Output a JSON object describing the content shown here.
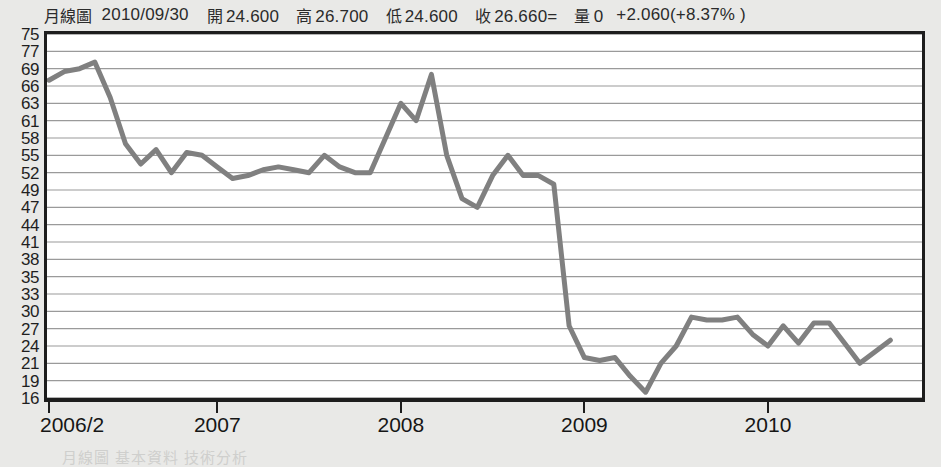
{
  "quote": {
    "chart_type_label": "月線圖",
    "date": "2010/09/30",
    "open_label": "開",
    "open": "24.600",
    "high_label": "高",
    "high": "26.700",
    "low_label": "低",
    "low": "24.600",
    "close_label": "收",
    "close": "26.660=",
    "volume_label": "量",
    "volume": "0",
    "change": "+2.060(+8.37% )"
  },
  "footnote": "月線圖 基本資料 技術分析",
  "colors": {
    "line": "#808080",
    "gridline": "#9a9a9a",
    "frame": "#1d1d1d",
    "plot_background": "#ffffff",
    "page_background": "#e9e9e7",
    "text": "#1f1f1f"
  },
  "chart_data": {
    "type": "line",
    "title": "月線圖 2010/09/30",
    "xlabel": "",
    "ylabel": "",
    "grid": true,
    "legend": false,
    "series_name": "月收盤價",
    "ylim": [
      16,
      75
    ],
    "y_tick_labels": [
      "75",
      "77",
      "69",
      "66",
      "63",
      "61",
      "58",
      "55",
      "52",
      "49",
      "47",
      "44",
      "41",
      "38",
      "35",
      "33",
      "30",
      "27",
      "24",
      "21",
      "19",
      "16"
    ],
    "x_tick_labels": [
      "2006/2",
      "2007",
      "2008",
      "2009",
      "2010"
    ],
    "x_tick_positions_months": [
      0,
      11,
      23,
      35,
      47
    ],
    "x": [
      "2006/2",
      "2006/3",
      "2006/4",
      "2006/5",
      "2006/6",
      "2006/7",
      "2006/8",
      "2006/9",
      "2006/10",
      "2006/11",
      "2006/12",
      "2007/1",
      "2007/2",
      "2007/3",
      "2007/4",
      "2007/5",
      "2007/6",
      "2007/7",
      "2007/8",
      "2007/9",
      "2007/10",
      "2007/11",
      "2007/12",
      "2008/1",
      "2008/2",
      "2008/3",
      "2008/4",
      "2008/5",
      "2008/6",
      "2008/7",
      "2008/8",
      "2008/9",
      "2008/10",
      "2008/11",
      "2008/12",
      "2009/1",
      "2009/2",
      "2009/3",
      "2009/4",
      "2009/5",
      "2009/6",
      "2009/7",
      "2009/8",
      "2009/9",
      "2009/10",
      "2009/11",
      "2009/12",
      "2010/1",
      "2010/2",
      "2010/3",
      "2010/4",
      "2010/5",
      "2010/6",
      "2010/7",
      "2010/8",
      "2010/9"
    ],
    "values": [
      67.0,
      68.5,
      69.0,
      72.0,
      64.0,
      57.0,
      53.5,
      56.0,
      52.0,
      55.5,
      55.0,
      53.0,
      51.0,
      51.5,
      52.5,
      53.0,
      52.5,
      52.0,
      55.0,
      53.0,
      52.0,
      52.0,
      58.0,
      63.0,
      61.0,
      68.0,
      55.0,
      48.0,
      47.0,
      51.5,
      55.0,
      51.5,
      51.5,
      50.0,
      27.5,
      22.0,
      21.5,
      22.0,
      19.5,
      17.0,
      21.0,
      24.0,
      29.0,
      28.5,
      28.5,
      29.0,
      26.0,
      24.0,
      27.5,
      24.5,
      28.0,
      28.0,
      24.5,
      21.0,
      23.0,
      25.0
    ]
  }
}
